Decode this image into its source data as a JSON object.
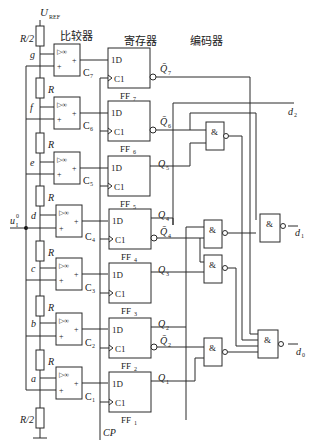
{
  "titles": {
    "comparator": "比较器",
    "register": "寄存器",
    "encoder": "编码器"
  },
  "reference": {
    "label": "U",
    "sub": "REF"
  },
  "input": {
    "label": "u",
    "sub": "I",
    "sup": "0"
  },
  "clock_label": "CP",
  "resistors": [
    "R/2",
    "R",
    "R",
    "R",
    "R",
    "R",
    "R",
    "R/2"
  ],
  "nodes": [
    "g",
    "f",
    "e",
    "d",
    "c",
    "b",
    "a"
  ],
  "comparators": [
    {
      "name": "C",
      "sub": "7"
    },
    {
      "name": "C",
      "sub": "6"
    },
    {
      "name": "C",
      "sub": "5"
    },
    {
      "name": "C",
      "sub": "4"
    },
    {
      "name": "C",
      "sub": "3"
    },
    {
      "name": "C",
      "sub": "2"
    },
    {
      "name": "C",
      "sub": "1"
    }
  ],
  "comparator_symbol": "▷∞",
  "flipflops": [
    {
      "name": "FF",
      "sub": "7",
      "d": "1D",
      "c": "C1"
    },
    {
      "name": "FF",
      "sub": "6",
      "d": "1D",
      "c": "C1"
    },
    {
      "name": "FF",
      "sub": "5",
      "d": "1D",
      "c": "C1"
    },
    {
      "name": "FF",
      "sub": "4",
      "d": "1D",
      "c": "C1"
    },
    {
      "name": "FF",
      "sub": "3",
      "d": "1D",
      "c": "C1"
    },
    {
      "name": "FF",
      "sub": "2",
      "d": "1D",
      "c": "C1"
    },
    {
      "name": "FF",
      "sub": "1",
      "d": "1D",
      "c": "C1"
    }
  ],
  "outputs_q": [
    {
      "label": "Q̄",
      "sub": "7"
    },
    {
      "label": "Q̄",
      "sub": "6"
    },
    {
      "label": "Q",
      "sub": "5"
    },
    {
      "label": "Q",
      "sub": "4"
    },
    {
      "label": "Q̄",
      "sub": "4"
    },
    {
      "label": "Q",
      "sub": "3"
    },
    {
      "label": "Q",
      "sub": "2"
    },
    {
      "label": "Q̄",
      "sub": "2"
    },
    {
      "label": "Q",
      "sub": "1"
    }
  ],
  "gate_symbol": "&",
  "digital_outputs": [
    {
      "label": "d",
      "sub": "2"
    },
    {
      "label": "d",
      "sub": "1"
    },
    {
      "label": "d",
      "sub": "0"
    }
  ]
}
